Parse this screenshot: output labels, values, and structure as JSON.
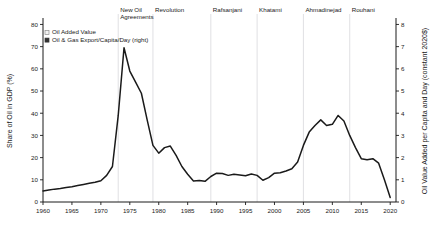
{
  "chart_data": {
    "type": "line",
    "title": "",
    "subtitle": "",
    "xlabel": "",
    "ylabel": "Share of Oil in GDP (%)",
    "y2label": "Oil Value Added per Capita and Day (constant 2020$)",
    "xlim": [
      1960,
      2021
    ],
    "ylim": [
      0,
      82
    ],
    "y2lim": [
      0,
      8.2
    ],
    "grid": false,
    "legend_position": "top-left",
    "xticks": [
      1960,
      1965,
      1970,
      1975,
      1980,
      1985,
      1990,
      1995,
      2000,
      2005,
      2010,
      2015,
      2020
    ],
    "xticklabels": [
      "1960",
      "1965",
      "1970",
      "1975",
      "1980",
      "1985",
      "1990",
      "1995",
      "2000",
      "2005",
      "2010",
      "2015",
      "2020"
    ],
    "yticks": [
      0,
      10,
      20,
      30,
      40,
      50,
      60,
      70,
      80
    ],
    "yticklabels": [
      "0",
      "10",
      "20",
      "30",
      "40",
      "50",
      "60",
      "70",
      "80"
    ],
    "y2ticks": [
      0,
      1,
      2,
      3,
      4,
      5,
      6,
      7,
      8
    ],
    "y2ticklabels": [
      "0",
      "1",
      "2",
      "3",
      "4",
      "5",
      "6",
      "7",
      "8"
    ],
    "legend": [
      {
        "name": "Oil Added Value",
        "marker": "square",
        "color": "#f2f2f2",
        "edge": "#8c8c8c"
      },
      {
        "name": "Oil & Gas Export/Capita/Day (right)",
        "marker": "square",
        "color": "#333333",
        "edge": "#333333"
      }
    ],
    "series": [
      {
        "name": "Oil Added Value",
        "color": "#1a1a1a",
        "x": [
          1960,
          1961,
          1962,
          1963,
          1964,
          1965,
          1966,
          1967,
          1968,
          1969,
          1970,
          1971,
          1972,
          1973,
          1974,
          1975,
          1976,
          1977,
          1978,
          1979,
          1980,
          1981,
          1982,
          1983,
          1984,
          1985,
          1986,
          1987,
          1988,
          1989,
          1990,
          1991,
          1992,
          1993,
          1994,
          1995,
          1996,
          1997,
          1998,
          1999,
          2000,
          2001,
          2002,
          2003,
          2004,
          2005,
          2006,
          2007,
          2008,
          2009,
          2010,
          2011,
          2012,
          2013,
          2014,
          2015,
          2016,
          2017,
          2018,
          2019,
          2020
        ],
        "values": [
          5.0,
          5.4,
          5.8,
          6.1,
          6.5,
          6.9,
          7.4,
          7.9,
          8.4,
          8.9,
          9.6,
          12.0,
          16.0,
          39.0,
          69.5,
          59.0,
          54.0,
          49.0,
          37.0,
          25.5,
          22.0,
          24.5,
          25.2,
          21.0,
          16.0,
          12.5,
          9.5,
          9.7,
          9.3,
          11.5,
          13.0,
          12.8,
          12.0,
          12.5,
          12.2,
          11.8,
          12.6,
          12.0,
          9.8,
          11.0,
          13.0,
          13.2,
          14.0,
          15.0,
          18.0,
          25.5,
          31.5,
          34.5,
          37.0,
          34.5,
          35.0,
          39.0,
          36.5,
          30.0,
          24.5,
          19.5,
          19.0,
          19.5,
          17.5,
          10.0,
          2.0
        ]
      }
    ],
    "annotations": [
      {
        "label": "New Oil Agreements",
        "year": 1973,
        "divider": true
      },
      {
        "label": "Revolution",
        "year": 1979,
        "divider": true
      },
      {
        "label": "Rafsanjani",
        "year": 1989,
        "divider": true
      },
      {
        "label": "Khatami",
        "year": 1997,
        "divider": true
      },
      {
        "label": "Ahmadinejad",
        "year": 2005,
        "divider": true
      },
      {
        "label": "Rouhani",
        "year": 2013,
        "divider": true
      }
    ]
  }
}
